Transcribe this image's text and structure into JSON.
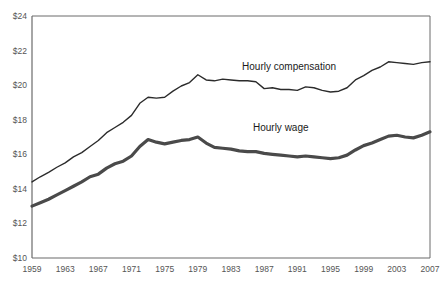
{
  "chart_data": {
    "type": "line",
    "title": "",
    "subtitle": "",
    "xlabel": "",
    "ylabel": "",
    "xlim": [
      1959,
      2007
    ],
    "ylim": [
      10,
      24
    ],
    "grid": false,
    "legend_position": "inline-annotation",
    "y_ticks": [
      10,
      12,
      14,
      16,
      18,
      20,
      22,
      24
    ],
    "y_tick_labels": [
      "$10",
      "$12",
      "$14",
      "$16",
      "$18",
      "$20",
      "$22",
      "$24"
    ],
    "x_ticks": [
      1959,
      1963,
      1967,
      1971,
      1975,
      1979,
      1983,
      1987,
      1991,
      1995,
      1999,
      2003,
      2007
    ],
    "x_tick_labels": [
      "1959",
      "1963",
      "1967",
      "1971",
      "1975",
      "1979",
      "1983",
      "1987",
      "1991",
      "1995",
      "1999",
      "2003",
      "2007"
    ],
    "x": [
      1959,
      1960,
      1961,
      1962,
      1963,
      1964,
      1965,
      1966,
      1967,
      1968,
      1969,
      1970,
      1971,
      1972,
      1973,
      1974,
      1975,
      1976,
      1977,
      1978,
      1979,
      1980,
      1981,
      1982,
      1983,
      1984,
      1985,
      1986,
      1987,
      1988,
      1989,
      1990,
      1991,
      1992,
      1993,
      1994,
      1995,
      1996,
      1997,
      1998,
      1999,
      2000,
      2001,
      2002,
      2003,
      2004,
      2005,
      2006,
      2007
    ],
    "series": [
      {
        "name": "Hourly compensation",
        "label": "Hourly compensation",
        "color": "#2b2b2b",
        "line_width": 1.4,
        "label_x": 1990,
        "label_y": 20.9,
        "values": [
          14.4,
          14.7,
          14.95,
          15.25,
          15.5,
          15.85,
          16.1,
          16.45,
          16.8,
          17.25,
          17.55,
          17.85,
          18.25,
          18.95,
          19.3,
          19.25,
          19.3,
          19.65,
          19.95,
          20.15,
          20.6,
          20.3,
          20.25,
          20.35,
          20.3,
          20.25,
          20.25,
          20.2,
          19.8,
          19.85,
          19.75,
          19.75,
          19.7,
          19.9,
          19.85,
          19.7,
          19.6,
          19.65,
          19.85,
          20.3,
          20.55,
          20.85,
          21.05,
          21.35,
          21.3,
          21.25,
          21.2,
          21.3,
          21.35
        ]
      },
      {
        "name": "Hourly wage",
        "label": "Hourly wage",
        "color": "#4a4a4a",
        "line_width": 3.2,
        "label_x": 1989,
        "label_y": 17.35,
        "values": [
          13.0,
          13.2,
          13.4,
          13.65,
          13.9,
          14.15,
          14.4,
          14.7,
          14.85,
          15.2,
          15.45,
          15.6,
          15.9,
          16.45,
          16.85,
          16.7,
          16.6,
          16.7,
          16.8,
          16.85,
          17.0,
          16.65,
          16.4,
          16.35,
          16.3,
          16.2,
          16.15,
          16.15,
          16.05,
          16.0,
          15.95,
          15.9,
          15.85,
          15.9,
          15.85,
          15.8,
          15.75,
          15.8,
          15.95,
          16.25,
          16.5,
          16.65,
          16.85,
          17.05,
          17.1,
          17.0,
          16.95,
          17.1,
          17.3
        ]
      }
    ]
  },
  "layout": {
    "plot_left": 32,
    "plot_top": 16,
    "plot_right": 430,
    "plot_bottom": 258,
    "axis_color": "#6b6b6b"
  }
}
